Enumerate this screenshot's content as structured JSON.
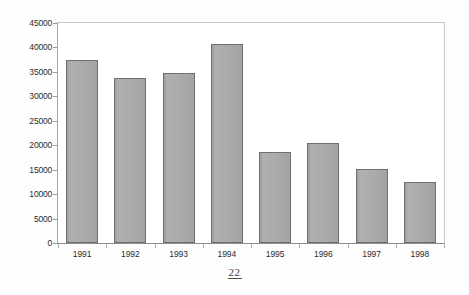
{
  "page": {
    "page_number": "22",
    "background_color": "#ffffff"
  },
  "chart_data": {
    "type": "bar",
    "title": "",
    "subtitle": "",
    "xlabel": "",
    "ylabel": "",
    "categories": [
      "1991",
      "1992",
      "1993",
      "1994",
      "1995",
      "1996",
      "1997",
      "1998"
    ],
    "values": [
      37500,
      33800,
      34700,
      40800,
      18700,
      20400,
      15100,
      12500
    ],
    "series": [
      {
        "name": "",
        "values": [
          37500,
          33800,
          34700,
          40800,
          18700,
          20400,
          15100,
          12500
        ]
      }
    ],
    "ylim": [
      0,
      45000
    ],
    "ytick_values": [
      0,
      5000,
      10000,
      15000,
      20000,
      25000,
      30000,
      35000,
      40000,
      45000
    ],
    "ytick_labels": [
      "0",
      "5000",
      "10000",
      "15000",
      "20000",
      "25000",
      "30000",
      "35000",
      "40000",
      "45000"
    ],
    "grid": false,
    "legend": false,
    "legend_position": "none",
    "bar_fill_color": "#a8a8a8",
    "bar_border_color": "#6f6f6f",
    "axis_color": "#8e8e8e",
    "text_color": "#2b2b2b"
  }
}
